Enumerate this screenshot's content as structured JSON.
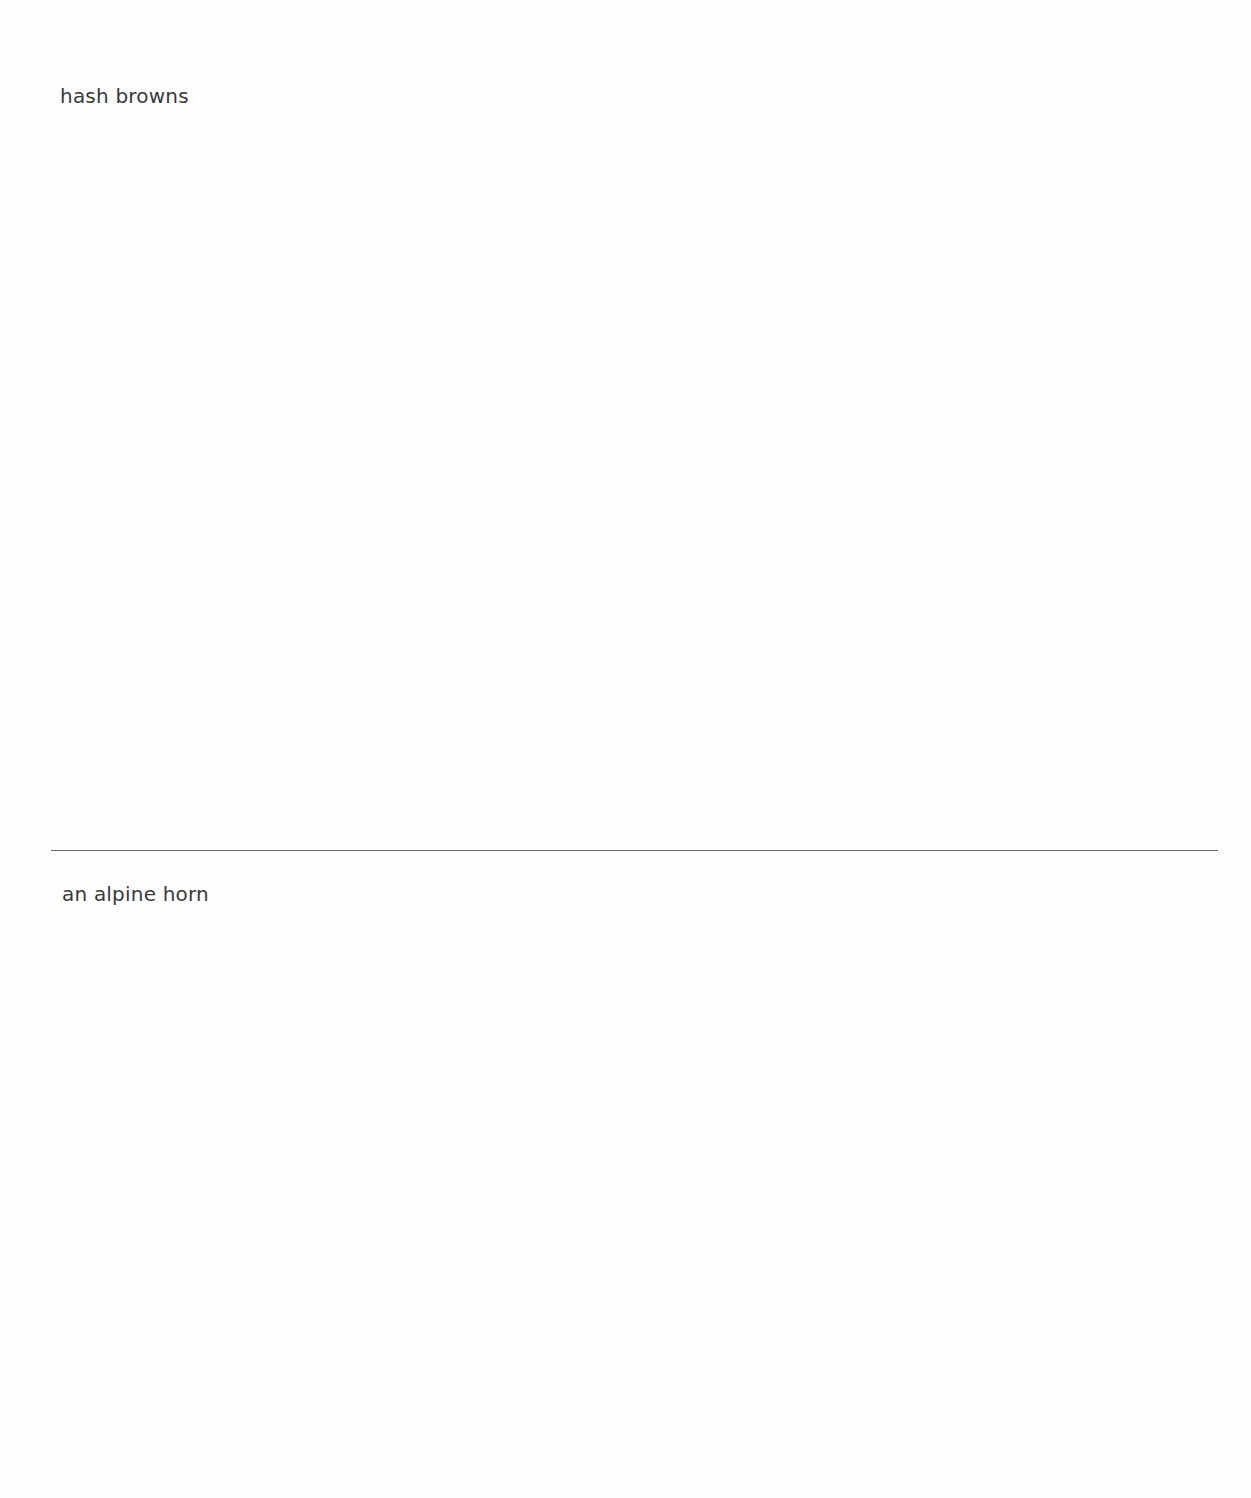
{
  "page": {
    "type": "drawing-prompt-sheet",
    "background_color": "#fefefe",
    "text_color": "#3a3a3a",
    "divider_color": "#6a6a6a"
  },
  "sections": [
    {
      "label": "hash browns"
    },
    {
      "label": "an alpine horn"
    }
  ]
}
